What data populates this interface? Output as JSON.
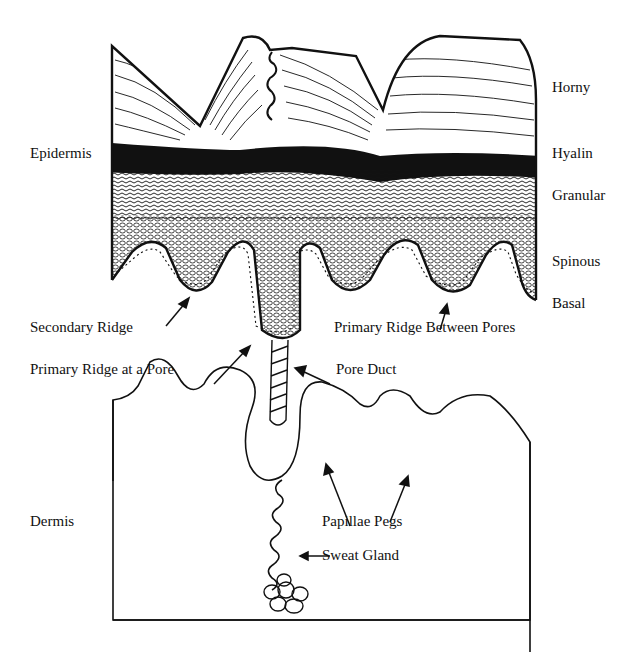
{
  "diagram": {
    "regions": {
      "epidermis": "Epidermis",
      "dermis": "Dermis"
    },
    "layers": [
      {
        "name": "Horny"
      },
      {
        "name": "Hyalin"
      },
      {
        "name": "Granular"
      },
      {
        "name": "Spinous"
      },
      {
        "name": "Basal"
      }
    ],
    "structures": {
      "secondary_ridge": "Secondary Ridge",
      "primary_ridge_between_pores": "Primary Ridge Between Pores",
      "primary_ridge_at_pore": "Primary Ridge at a Pore",
      "pore_duct": "Pore Duct",
      "papillae_pegs": "Papillae Pegs",
      "sweat_gland": "Sweat Gland"
    },
    "colors": {
      "ink": "#111111",
      "background": "#ffffff"
    }
  }
}
